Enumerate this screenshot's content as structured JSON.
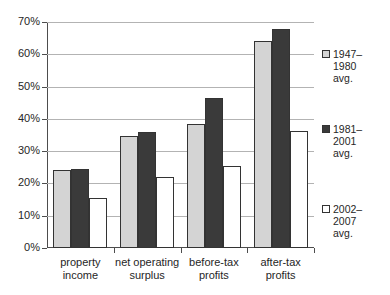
{
  "chart_data": {
    "type": "bar",
    "title": "",
    "xlabel": "",
    "ylabel": "",
    "ylim": [
      0,
      70
    ],
    "grid": true,
    "legend_position": "right",
    "categories": [
      "property\nincome",
      "net operating\nsurplus",
      "before-tax\nprofits",
      "after-tax\nprofits"
    ],
    "ytick_labels": [
      "0%",
      "10%",
      "20%",
      "30%",
      "40%",
      "50%",
      "60%",
      "70%"
    ],
    "ytick_values": [
      0,
      10,
      20,
      30,
      40,
      50,
      60,
      70
    ],
    "series": [
      {
        "name": "1947–\n1980\navg.",
        "color": "#d4d4d4",
        "values": [
          24.1,
          34.8,
          38.4,
          64.1
        ]
      },
      {
        "name": "1981–\n2001\navg.",
        "color": "#3a3a3a",
        "values": [
          24.5,
          35.8,
          46.4,
          67.8
        ]
      },
      {
        "name": "2002–\n2007\navg.",
        "color": "#ffffff",
        "values": [
          15.5,
          22.0,
          25.3,
          36.2
        ]
      }
    ]
  },
  "legend": {
    "items": [
      {
        "label": "1947–\n1980\navg.",
        "swatch": "light-gray-square"
      },
      {
        "label": "1981–\n2001\navg.",
        "swatch": "dark-gray-square"
      },
      {
        "label": "2002–\n2007\navg.",
        "swatch": "white-square"
      }
    ]
  }
}
